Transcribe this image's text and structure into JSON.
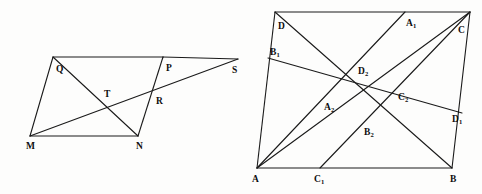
{
  "figure": {
    "background_color": "#fdfdfc",
    "line_color": "#1a1a1a",
    "label_color": "#0d0d0d"
  },
  "left_figure": {
    "name": "parallelogram-MNPQ-with-transversal",
    "points": [
      {
        "id": "M",
        "label": "M",
        "sub": "",
        "x": 30,
        "y": 136,
        "lx": 26,
        "ly": 149
      },
      {
        "id": "N",
        "label": "N",
        "sub": "",
        "x": 138,
        "y": 136,
        "lx": 136,
        "ly": 149
      },
      {
        "id": "Q",
        "label": "Q",
        "sub": "",
        "x": 53,
        "y": 57,
        "lx": 56,
        "ly": 72
      },
      {
        "id": "P",
        "label": "P",
        "sub": "",
        "x": 163,
        "y": 57,
        "lx": 166,
        "ly": 71
      },
      {
        "id": "S",
        "label": "S",
        "sub": "",
        "x": 238,
        "y": 59,
        "lx": 232,
        "ly": 73
      },
      {
        "id": "T",
        "label": "T",
        "sub": "",
        "x": 107,
        "y": 100,
        "lx": 104,
        "ly": 97
      },
      {
        "id": "R",
        "label": "R",
        "sub": "",
        "x": 157,
        "y": 103,
        "lx": 156,
        "ly": 104
      }
    ],
    "segments": [
      {
        "name": "side-QP-top",
        "from": "Q",
        "to": "P"
      },
      {
        "name": "side-PS-top-ext",
        "from": "P",
        "to": "S"
      },
      {
        "name": "side-MN-bottom",
        "from": "M",
        "to": "N"
      },
      {
        "name": "side-MQ-left",
        "from": "M",
        "to": "Q"
      },
      {
        "name": "diagonal-QN",
        "from": "Q",
        "to": "N"
      },
      {
        "name": "line-MS-transversal",
        "from": "M",
        "to": "S"
      },
      {
        "name": "line-PN",
        "from": "P",
        "to": "N"
      }
    ]
  },
  "right_figure": {
    "name": "parallelogram-ABCD-with-cevians",
    "points": [
      {
        "id": "A",
        "label": "A",
        "sub": "",
        "x": 17,
        "y": 168,
        "lx": 12,
        "ly": 182
      },
      {
        "id": "B",
        "label": "B",
        "sub": "",
        "x": 212,
        "y": 168,
        "lx": 210,
        "ly": 182
      },
      {
        "id": "C",
        "label": "C",
        "sub": "",
        "x": 230,
        "y": 12,
        "lx": 218,
        "ly": 33
      },
      {
        "id": "D",
        "label": "D",
        "sub": "",
        "x": 35,
        "y": 12,
        "lx": 38,
        "ly": 29
      },
      {
        "id": "A1",
        "label": "A",
        "sub": "1",
        "x": 165,
        "y": 12,
        "lx": 166,
        "ly": 26
      },
      {
        "id": "B1",
        "label": "B",
        "sub": "1",
        "x": 28,
        "y": 58,
        "lx": 30,
        "ly": 55
      },
      {
        "id": "C1",
        "label": "C",
        "sub": "1",
        "x": 80,
        "y": 168,
        "lx": 74,
        "ly": 182
      },
      {
        "id": "D1",
        "label": "D",
        "sub": "1",
        "x": 222,
        "y": 113,
        "lx": 212,
        "ly": 122
      },
      {
        "id": "A2",
        "label": "A",
        "sub": "2",
        "x": 85,
        "y": 100,
        "lx": 84,
        "ly": 110
      },
      {
        "id": "B2",
        "label": "B",
        "sub": "2",
        "x": 124,
        "y": 124,
        "lx": 124,
        "ly": 135
      },
      {
        "id": "C2",
        "label": "C",
        "sub": "2",
        "x": 158,
        "y": 90,
        "lx": 158,
        "ly": 100
      },
      {
        "id": "D2",
        "label": "D",
        "sub": "2",
        "x": 120,
        "y": 62,
        "lx": 118,
        "ly": 74
      }
    ],
    "segments": [
      {
        "name": "side-DC-top",
        "from": "D",
        "to": "C"
      },
      {
        "name": "side-AB-bottom",
        "from": "A",
        "to": "B"
      },
      {
        "name": "side-AD-left",
        "from": "A",
        "to": "D"
      },
      {
        "name": "side-BC-right",
        "from": "B",
        "to": "C"
      },
      {
        "name": "cevian-D-to-B",
        "from": "D",
        "to": "B"
      },
      {
        "name": "cevian-A-to-A1",
        "from": "A",
        "to": "A1"
      },
      {
        "name": "cevian-A-to-C",
        "from": "A",
        "to": "C"
      },
      {
        "name": "cevian-B1-to-D1",
        "from": "B1",
        "to": "D1"
      },
      {
        "name": "cevian-C1-to-C",
        "from": "C1",
        "to": "C"
      }
    ]
  }
}
